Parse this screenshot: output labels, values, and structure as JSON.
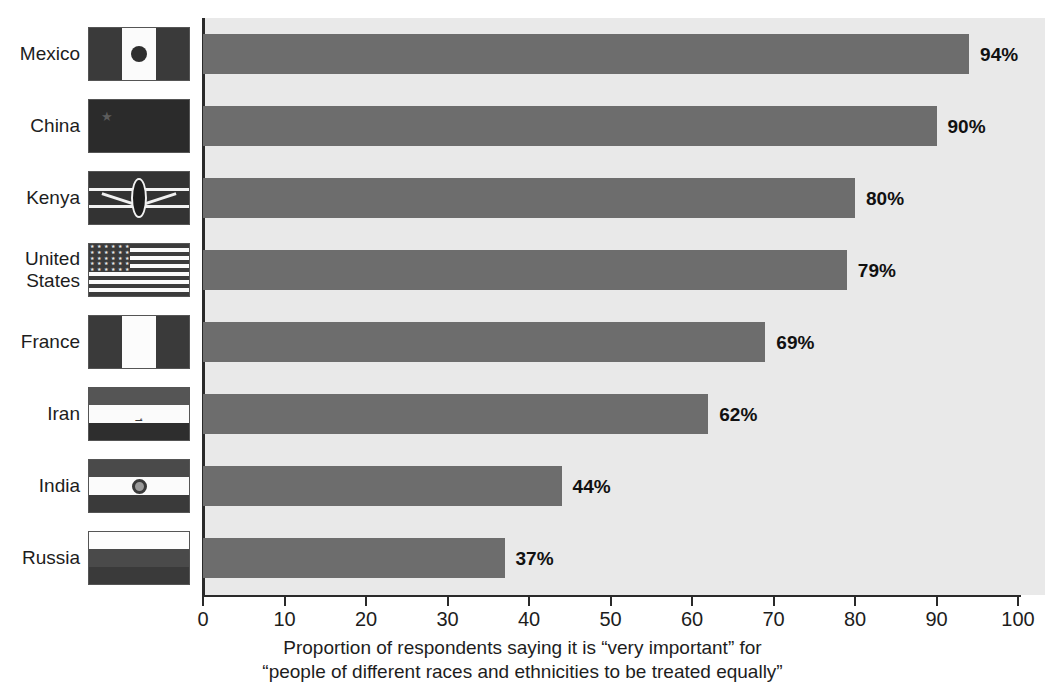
{
  "chart_data": {
    "type": "bar",
    "orientation": "horizontal",
    "title": "",
    "subtitle": "",
    "categories": [
      "Mexico",
      "China",
      "Kenya",
      "United States",
      "France",
      "Iran",
      "India",
      "Russia"
    ],
    "values": [
      94,
      90,
      80,
      79,
      69,
      62,
      44,
      37
    ],
    "value_labels": [
      "94%",
      "90%",
      "80%",
      "79%",
      "69%",
      "62%",
      "44%",
      "37%"
    ],
    "xlabel_lines": [
      "Proportion of respondents saying it is “very important” for",
      "“people of different races and ethnicities to be treated equally”"
    ],
    "ylabel": "",
    "xlim": [
      0,
      100
    ],
    "xticks": [
      0,
      10,
      20,
      30,
      40,
      50,
      60,
      70,
      80,
      90,
      100
    ],
    "xtick_labels": [
      "0",
      "10",
      "20",
      "30",
      "40",
      "50",
      "60",
      "70",
      "80",
      "90",
      "100"
    ],
    "grid": false,
    "legend": null,
    "colors": {
      "bar": "#6d6d6d",
      "plot_background": "#e9e9e9",
      "page_background": "#ffffff",
      "axis": "#2a2a2a",
      "text": "#1d1d1d"
    }
  },
  "rows": [
    {
      "country": "Mexico",
      "label_lines": [
        "Mexico"
      ],
      "value": 94,
      "value_label": "94%",
      "flag_name": "flag-mexico",
      "flag_type": "vertical-tricolor-emblem"
    },
    {
      "country": "China",
      "label_lines": [
        "China"
      ],
      "value": 90,
      "value_label": "90%",
      "flag_name": "flag-china",
      "flag_type": "solid-star"
    },
    {
      "country": "Kenya",
      "label_lines": [
        "Kenya"
      ],
      "value": 80,
      "value_label": "80%",
      "flag_name": "flag-kenya",
      "flag_type": "horizontal-bands-shield"
    },
    {
      "country": "United States",
      "label_lines": [
        "United",
        "States"
      ],
      "value": 79,
      "value_label": "79%",
      "flag_name": "flag-united-states",
      "flag_type": "stars-and-stripes"
    },
    {
      "country": "France",
      "label_lines": [
        "France"
      ],
      "value": 69,
      "value_label": "69%",
      "flag_name": "flag-france",
      "flag_type": "vertical-tricolor"
    },
    {
      "country": "Iran",
      "label_lines": [
        "Iran"
      ],
      "value": 62,
      "value_label": "62%",
      "flag_name": "flag-iran",
      "flag_type": "horizontal-tricolor-emblem"
    },
    {
      "country": "India",
      "label_lines": [
        "India"
      ],
      "value": 44,
      "value_label": "44%",
      "flag_name": "flag-india",
      "flag_type": "horizontal-tricolor-wheel"
    },
    {
      "country": "Russia",
      "label_lines": [
        "Russia"
      ],
      "value": 37,
      "value_label": "37%",
      "flag_name": "flag-russia",
      "flag_type": "horizontal-tricolor"
    }
  ]
}
